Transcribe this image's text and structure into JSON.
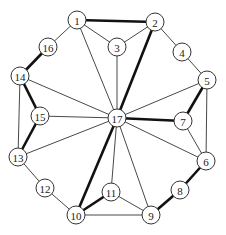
{
  "graph": {
    "node_radius": 9,
    "nodes": [
      {
        "id": "1",
        "x": 77,
        "y": 20
      },
      {
        "id": "2",
        "x": 155,
        "y": 22
      },
      {
        "id": "3",
        "x": 117,
        "y": 47
      },
      {
        "id": "4",
        "x": 182,
        "y": 52
      },
      {
        "id": "5",
        "x": 207,
        "y": 80
      },
      {
        "id": "16",
        "x": 48,
        "y": 47
      },
      {
        "id": "14",
        "x": 20,
        "y": 76
      },
      {
        "id": "15",
        "x": 40,
        "y": 116
      },
      {
        "id": "17",
        "x": 117,
        "y": 118
      },
      {
        "id": "7",
        "x": 183,
        "y": 121
      },
      {
        "id": "13",
        "x": 18,
        "y": 157
      },
      {
        "id": "6",
        "x": 206,
        "y": 161
      },
      {
        "id": "12",
        "x": 45,
        "y": 188
      },
      {
        "id": "8",
        "x": 180,
        "y": 190
      },
      {
        "id": "11",
        "x": 111,
        "y": 192
      },
      {
        "id": "10",
        "x": 76,
        "y": 215
      },
      {
        "id": "9",
        "x": 151,
        "y": 215
      }
    ],
    "edges": [
      {
        "from": "1",
        "to": "2",
        "bold": true
      },
      {
        "from": "1",
        "to": "16",
        "bold": false
      },
      {
        "from": "1",
        "to": "3",
        "bold": false
      },
      {
        "from": "1",
        "to": "17",
        "bold": false
      },
      {
        "from": "2",
        "to": "3",
        "bold": false
      },
      {
        "from": "2",
        "to": "4",
        "bold": false
      },
      {
        "from": "2",
        "to": "17",
        "bold": true
      },
      {
        "from": "3",
        "to": "17",
        "bold": false
      },
      {
        "from": "4",
        "to": "5",
        "bold": false
      },
      {
        "from": "5",
        "to": "17",
        "bold": false
      },
      {
        "from": "5",
        "to": "7",
        "bold": true
      },
      {
        "from": "5",
        "to": "6",
        "bold": false
      },
      {
        "from": "16",
        "to": "14",
        "bold": true
      },
      {
        "from": "14",
        "to": "15",
        "bold": true
      },
      {
        "from": "14",
        "to": "13",
        "bold": false
      },
      {
        "from": "14",
        "to": "17",
        "bold": false
      },
      {
        "from": "15",
        "to": "17",
        "bold": false
      },
      {
        "from": "15",
        "to": "13",
        "bold": true
      },
      {
        "from": "13",
        "to": "17",
        "bold": false
      },
      {
        "from": "13",
        "to": "12",
        "bold": false
      },
      {
        "from": "12",
        "to": "10",
        "bold": false
      },
      {
        "from": "17",
        "to": "7",
        "bold": true
      },
      {
        "from": "7",
        "to": "6",
        "bold": false
      },
      {
        "from": "17",
        "to": "6",
        "bold": false
      },
      {
        "from": "6",
        "to": "8",
        "bold": true
      },
      {
        "from": "8",
        "to": "9",
        "bold": true
      },
      {
        "from": "17",
        "to": "10",
        "bold": true
      },
      {
        "from": "17",
        "to": "11",
        "bold": false
      },
      {
        "from": "17",
        "to": "9",
        "bold": false
      },
      {
        "from": "11",
        "to": "10",
        "bold": true
      },
      {
        "from": "11",
        "to": "9",
        "bold": false
      },
      {
        "from": "10",
        "to": "9",
        "bold": false
      }
    ]
  }
}
